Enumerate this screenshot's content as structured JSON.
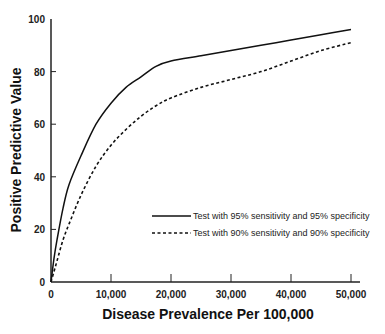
{
  "chart_data": {
    "type": "line",
    "title": "",
    "xlabel": "Disease Prevalence Per 100,000",
    "ylabel": "Positive Predictive Value",
    "xlim": [
      0,
      50000
    ],
    "ylim": [
      0,
      100
    ],
    "xticks": [
      0,
      10000,
      20000,
      30000,
      40000,
      50000
    ],
    "xtick_labels": [
      "0",
      "10,000",
      "20,000",
      "30,000",
      "40,000",
      "50,000"
    ],
    "yticks": [
      0,
      20,
      40,
      60,
      80,
      100
    ],
    "ytick_labels": [
      "0",
      "20",
      "40",
      "60",
      "80",
      "100"
    ],
    "grid": false,
    "legend_position": "center-right",
    "series": [
      {
        "name": "Test with 95% sensitivity and 95% specificity",
        "style": "solid",
        "x": [
          0,
          500,
          1000,
          2000,
          3000,
          5000,
          7500,
          10000,
          12500,
          15000,
          17500,
          20000,
          25000,
          30000,
          35000,
          40000,
          45000,
          50000
        ],
        "values": [
          0,
          9,
          16,
          28,
          37,
          48,
          60,
          68,
          74,
          78,
          82,
          84,
          86,
          88,
          90,
          92,
          94,
          96
        ]
      },
      {
        "name": "Test with 90% sensitivity and 90% specificity",
        "style": "dashed",
        "x": [
          0,
          500,
          1000,
          2000,
          3000,
          5000,
          7500,
          10000,
          12500,
          15000,
          17500,
          20000,
          25000,
          30000,
          35000,
          40000,
          45000,
          50000
        ],
        "values": [
          0,
          4,
          8,
          16,
          22,
          33,
          44,
          52,
          58,
          63,
          67,
          70,
          74,
          77,
          80,
          84,
          88,
          91
        ]
      }
    ]
  }
}
